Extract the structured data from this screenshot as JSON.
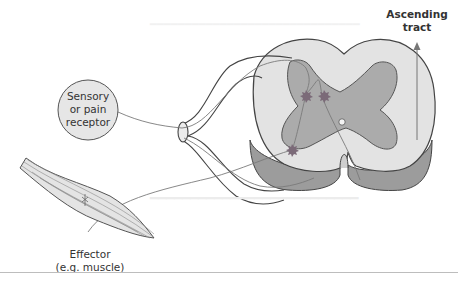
{
  "figure": {
    "type": "reflex-arc-diagram",
    "labels": {
      "receptor": "Sensory or pain receptor",
      "receptor_lines": [
        "Sensory",
        "or pain",
        "receptor"
      ],
      "tract": "Ascending tract",
      "tract_lines": [
        "Ascending",
        "tract"
      ],
      "effector": "Effector (e.g. muscle)",
      "effector_lines": [
        "Effector",
        "(e.g. muscle)"
      ]
    },
    "colors": {
      "white_matter": "#e2e2e2",
      "grey_matter": "#a9a9a9",
      "cut_surface": "#9a9a9a",
      "outline": "#444444",
      "neuron": "#777777",
      "synapse_star": "#7a6a78",
      "receptor_fill": "#e6e6e6",
      "muscle_fill": "#e4e4e4"
    }
  }
}
